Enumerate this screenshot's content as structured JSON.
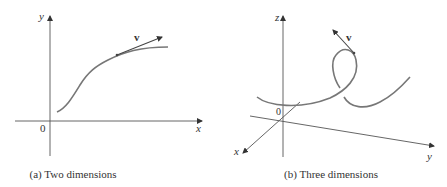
{
  "figures": [
    {
      "id": "a",
      "caption": "(a) Two dimensions",
      "axes": {
        "x_label": "x",
        "y_label": "y",
        "origin_label": "0"
      },
      "vector_label": "v"
    },
    {
      "id": "b",
      "caption": "(b) Three dimensions",
      "axes": {
        "x_label": "x",
        "y_label": "y",
        "z_label": "z",
        "origin_label": "0"
      },
      "vector_label": "v"
    }
  ],
  "colors": {
    "axis": "#444444",
    "curve": "#666666",
    "vector": "#444444"
  }
}
